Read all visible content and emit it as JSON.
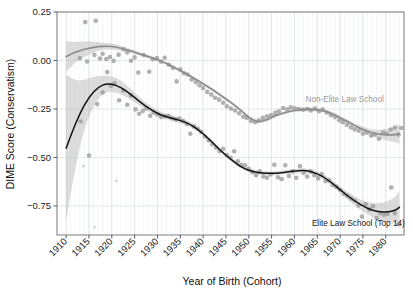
{
  "chart_data": {
    "type": "line",
    "title": "",
    "subtitle": "",
    "xlabel": "Year of Birth (Cohort)",
    "ylabel": "DIME Score (Conservatism)",
    "xlim": [
      1908,
      1984
    ],
    "ylim": [
      -0.9,
      0.25
    ],
    "grid": true,
    "legend_position": "inline-annotation",
    "xticks": [
      1910,
      1915,
      1920,
      1925,
      1930,
      1935,
      1940,
      1945,
      1950,
      1955,
      1960,
      1965,
      1970,
      1975,
      1980
    ],
    "xtick_labels": [
      "1910",
      "1915",
      "1920",
      "1925",
      "1930",
      "1935",
      "1940",
      "1945",
      "1950",
      "1955",
      "1960",
      "1965",
      "1970",
      "1975",
      "1980"
    ],
    "yticks": [
      0.25,
      0.0,
      -0.25,
      -0.5,
      -0.75
    ],
    "ytick_labels": [
      "0.25",
      "0.00",
      "−0.25",
      "−0.50",
      "−0.75"
    ],
    "annotations": [
      {
        "text": "Non-Elite Law School",
        "x": 1971,
        "y": -0.215,
        "color": "#9a9a9a"
      },
      {
        "text": "Elite Law School (Top 14)",
        "x": 1974,
        "y": -0.855,
        "color": "#1a1a1a"
      }
    ],
    "series": [
      {
        "name": "Non-Elite Law School",
        "color": "#8d8d8d",
        "band_color": "#b9b9b9",
        "x": [
          1910,
          1912,
          1914,
          1916,
          1918,
          1920,
          1922,
          1924,
          1926,
          1928,
          1930,
          1932,
          1934,
          1936,
          1938,
          1940,
          1942,
          1944,
          1946,
          1948,
          1950,
          1952,
          1954,
          1956,
          1958,
          1960,
          1962,
          1964,
          1966,
          1968,
          1970,
          1972,
          1974,
          1976,
          1978,
          1980,
          1982,
          1983
        ],
        "values": [
          0.02,
          0.042,
          0.058,
          0.068,
          0.073,
          0.072,
          0.063,
          0.05,
          0.035,
          0.02,
          0.004,
          -0.016,
          -0.04,
          -0.065,
          -0.092,
          -0.12,
          -0.15,
          -0.182,
          -0.215,
          -0.252,
          -0.292,
          -0.315,
          -0.305,
          -0.283,
          -0.268,
          -0.258,
          -0.252,
          -0.252,
          -0.258,
          -0.272,
          -0.295,
          -0.32,
          -0.345,
          -0.365,
          -0.378,
          -0.383,
          -0.382,
          -0.378
        ],
        "band_lower": [
          -0.06,
          -0.012,
          0.018,
          0.04,
          0.054,
          0.056,
          0.05,
          0.04,
          0.026,
          0.012,
          -0.003,
          -0.023,
          -0.047,
          -0.072,
          -0.099,
          -0.127,
          -0.157,
          -0.189,
          -0.222,
          -0.259,
          -0.3,
          -0.323,
          -0.313,
          -0.291,
          -0.276,
          -0.266,
          -0.26,
          -0.26,
          -0.266,
          -0.281,
          -0.305,
          -0.331,
          -0.358,
          -0.381,
          -0.399,
          -0.412,
          -0.422,
          -0.428
        ],
        "band_upper": [
          0.1,
          0.096,
          0.098,
          0.096,
          0.092,
          0.088,
          0.076,
          0.06,
          0.044,
          0.028,
          0.011,
          -0.009,
          -0.033,
          -0.058,
          -0.085,
          -0.113,
          -0.143,
          -0.175,
          -0.208,
          -0.245,
          -0.284,
          -0.307,
          -0.297,
          -0.275,
          -0.26,
          -0.25,
          -0.244,
          -0.244,
          -0.25,
          -0.263,
          -0.285,
          -0.309,
          -0.332,
          -0.349,
          -0.357,
          -0.354,
          -0.342,
          -0.328
        ]
      },
      {
        "name": "Elite Law School (Top 14)",
        "color": "#111111",
        "band_color": "#b9b9b9",
        "x": [
          1910,
          1912,
          1914,
          1916,
          1918,
          1920,
          1922,
          1924,
          1926,
          1928,
          1930,
          1932,
          1934,
          1936,
          1938,
          1940,
          1942,
          1944,
          1946,
          1948,
          1950,
          1952,
          1954,
          1956,
          1958,
          1960,
          1962,
          1964,
          1966,
          1968,
          1970,
          1972,
          1974,
          1976,
          1978,
          1980,
          1982,
          1983
        ],
        "values": [
          -0.452,
          -0.33,
          -0.23,
          -0.162,
          -0.127,
          -0.122,
          -0.14,
          -0.172,
          -0.21,
          -0.245,
          -0.272,
          -0.29,
          -0.303,
          -0.318,
          -0.342,
          -0.378,
          -0.422,
          -0.468,
          -0.508,
          -0.543,
          -0.566,
          -0.578,
          -0.582,
          -0.581,
          -0.576,
          -0.57,
          -0.568,
          -0.576,
          -0.596,
          -0.628,
          -0.666,
          -0.704,
          -0.736,
          -0.762,
          -0.777,
          -0.781,
          -0.772,
          -0.757
        ],
        "band_lower": [
          -0.83,
          -0.56,
          -0.36,
          -0.24,
          -0.175,
          -0.162,
          -0.175,
          -0.2,
          -0.232,
          -0.263,
          -0.288,
          -0.305,
          -0.317,
          -0.331,
          -0.354,
          -0.389,
          -0.432,
          -0.478,
          -0.518,
          -0.553,
          -0.576,
          -0.588,
          -0.592,
          -0.591,
          -0.587,
          -0.581,
          -0.58,
          -0.589,
          -0.61,
          -0.644,
          -0.684,
          -0.725,
          -0.762,
          -0.794,
          -0.818,
          -0.833,
          -0.84,
          -0.842
        ],
        "band_upper": [
          -0.074,
          -0.1,
          -0.1,
          -0.084,
          -0.079,
          -0.082,
          -0.105,
          -0.144,
          -0.188,
          -0.227,
          -0.256,
          -0.275,
          -0.289,
          -0.305,
          -0.33,
          -0.367,
          -0.412,
          -0.458,
          -0.498,
          -0.533,
          -0.556,
          -0.568,
          -0.572,
          -0.571,
          -0.565,
          -0.559,
          -0.556,
          -0.563,
          -0.582,
          -0.612,
          -0.648,
          -0.683,
          -0.71,
          -0.73,
          -0.736,
          -0.729,
          -0.704,
          -0.672
        ]
      }
    ],
    "scatter": [
      {
        "name": "Non-Elite Law School",
        "color": "#9b9b9b",
        "points": [
          [
            1914.2,
            0.198
          ],
          [
            1916.5,
            0.205
          ],
          [
            1913.0,
            0.012
          ],
          [
            1914.6,
            -0.005
          ],
          [
            1916.2,
            0.028
          ],
          [
            1917.4,
            0.01
          ],
          [
            1918.0,
            0.035
          ],
          [
            1918.8,
            0.008
          ],
          [
            1919.6,
            0.018
          ],
          [
            1920.4,
            -0.002
          ],
          [
            1921.5,
            0.03
          ],
          [
            1922.6,
            0.058
          ],
          [
            1923.4,
            0.042
          ],
          [
            1924.2,
            -0.002
          ],
          [
            1925.0,
            0.016
          ],
          [
            1925.8,
            -0.062
          ],
          [
            1927.0,
            0.028
          ],
          [
            1928.2,
            -0.058
          ],
          [
            1929.0,
            0.006
          ],
          [
            1929.9,
            0.012
          ],
          [
            1930.8,
            -0.006
          ],
          [
            1931.6,
            0.014
          ],
          [
            1932.5,
            -0.022
          ],
          [
            1933.4,
            -0.038
          ],
          [
            1934.2,
            -0.108
          ],
          [
            1935.0,
            -0.046
          ],
          [
            1935.8,
            -0.066
          ],
          [
            1936.6,
            -0.072
          ],
          [
            1937.5,
            -0.098
          ],
          [
            1938.4,
            -0.112
          ],
          [
            1939.2,
            -0.128
          ],
          [
            1940.0,
            -0.142
          ],
          [
            1940.9,
            -0.162
          ],
          [
            1941.8,
            -0.176
          ],
          [
            1942.6,
            -0.192
          ],
          [
            1943.5,
            -0.202
          ],
          [
            1944.4,
            -0.218
          ],
          [
            1945.2,
            -0.236
          ],
          [
            1946.1,
            -0.248
          ],
          [
            1947.0,
            -0.258
          ],
          [
            1947.9,
            -0.272
          ],
          [
            1948.8,
            -0.29
          ],
          [
            1949.6,
            -0.296
          ],
          [
            1950.5,
            -0.312
          ],
          [
            1951.4,
            -0.318
          ],
          [
            1952.2,
            -0.308
          ],
          [
            1953.1,
            -0.296
          ],
          [
            1954.0,
            -0.288
          ],
          [
            1954.9,
            -0.282
          ],
          [
            1955.8,
            -0.27
          ],
          [
            1956.6,
            -0.262
          ],
          [
            1957.5,
            -0.245
          ],
          [
            1958.4,
            -0.252
          ],
          [
            1959.2,
            -0.242
          ],
          [
            1960.1,
            -0.246
          ],
          [
            1961.0,
            -0.25
          ],
          [
            1961.9,
            -0.254
          ],
          [
            1962.8,
            -0.25
          ],
          [
            1963.6,
            -0.258
          ],
          [
            1964.5,
            -0.248
          ],
          [
            1965.4,
            -0.262
          ],
          [
            1966.2,
            -0.252
          ],
          [
            1967.1,
            -0.268
          ],
          [
            1968.0,
            -0.282
          ],
          [
            1968.9,
            -0.292
          ],
          [
            1969.8,
            -0.308
          ],
          [
            1970.6,
            -0.318
          ],
          [
            1971.5,
            -0.332
          ],
          [
            1972.4,
            -0.345
          ],
          [
            1973.2,
            -0.356
          ],
          [
            1974.1,
            -0.362
          ],
          [
            1975.0,
            -0.378
          ],
          [
            1975.9,
            -0.372
          ],
          [
            1976.8,
            -0.388
          ],
          [
            1977.6,
            -0.382
          ],
          [
            1978.5,
            -0.404
          ],
          [
            1979.4,
            -0.372
          ],
          [
            1980.2,
            -0.378
          ],
          [
            1981.1,
            -0.356
          ],
          [
            1982.0,
            -0.346
          ],
          [
            1982.8,
            -0.382
          ],
          [
            1983.4,
            -0.348
          ]
        ]
      },
      {
        "name": "Elite Law School (Top 14)",
        "color": "#8f8f8f",
        "points": [
          [
            1913.2,
            -0.315
          ],
          [
            1915.0,
            -0.49
          ],
          [
            1916.8,
            -0.225
          ],
          [
            1918.0,
            -0.165
          ],
          [
            1919.0,
            -0.06
          ],
          [
            1919.8,
            -0.13
          ],
          [
            1920.6,
            -0.118
          ],
          [
            1921.6,
            -0.205
          ],
          [
            1922.5,
            -0.155
          ],
          [
            1923.4,
            -0.228
          ],
          [
            1924.2,
            -0.18
          ],
          [
            1925.2,
            -0.252
          ],
          [
            1926.0,
            -0.275
          ],
          [
            1926.8,
            -0.26
          ],
          [
            1927.6,
            -0.248
          ],
          [
            1928.4,
            -0.285
          ],
          [
            1929.2,
            -0.268
          ],
          [
            1930.0,
            -0.278
          ],
          [
            1930.8,
            -0.292
          ],
          [
            1931.6,
            -0.288
          ],
          [
            1932.4,
            -0.285
          ],
          [
            1933.2,
            -0.298
          ],
          [
            1934.0,
            -0.305
          ],
          [
            1934.8,
            -0.3
          ],
          [
            1935.6,
            -0.312
          ],
          [
            1936.4,
            -0.326
          ],
          [
            1937.2,
            -0.378
          ],
          [
            1938.0,
            -0.34
          ],
          [
            1938.8,
            -0.352
          ],
          [
            1939.6,
            -0.368
          ],
          [
            1940.4,
            -0.392
          ],
          [
            1941.2,
            -0.412
          ],
          [
            1942.0,
            -0.432
          ],
          [
            1942.8,
            -0.45
          ],
          [
            1943.6,
            -0.468
          ],
          [
            1944.4,
            -0.455
          ],
          [
            1945.2,
            -0.488
          ],
          [
            1946.0,
            -0.502
          ],
          [
            1946.8,
            -0.468
          ],
          [
            1947.6,
            -0.52
          ],
          [
            1948.4,
            -0.538
          ],
          [
            1949.2,
            -0.54
          ],
          [
            1950.0,
            -0.558
          ],
          [
            1950.8,
            -0.576
          ],
          [
            1951.6,
            -0.592
          ],
          [
            1952.4,
            -0.572
          ],
          [
            1953.2,
            -0.598
          ],
          [
            1954.0,
            -0.605
          ],
          [
            1954.8,
            -0.588
          ],
          [
            1955.6,
            -0.538
          ],
          [
            1956.4,
            -0.602
          ],
          [
            1957.2,
            -0.612
          ],
          [
            1958.0,
            -0.54
          ],
          [
            1958.8,
            -0.596
          ],
          [
            1959.6,
            -0.572
          ],
          [
            1960.4,
            -0.605
          ],
          [
            1961.2,
            -0.545
          ],
          [
            1962.0,
            -0.58
          ],
          [
            1962.8,
            -0.598
          ],
          [
            1963.6,
            -0.572
          ],
          [
            1964.4,
            -0.592
          ],
          [
            1965.2,
            -0.608
          ],
          [
            1966.0,
            -0.586
          ],
          [
            1966.8,
            -0.622
          ],
          [
            1967.6,
            -0.618
          ],
          [
            1968.4,
            -0.642
          ],
          [
            1969.2,
            -0.652
          ],
          [
            1970.0,
            -0.668
          ],
          [
            1970.8,
            -0.688
          ],
          [
            1971.6,
            -0.698
          ],
          [
            1972.4,
            -0.712
          ],
          [
            1973.2,
            -0.722
          ],
          [
            1974.0,
            -0.748
          ],
          [
            1974.8,
            -0.805
          ],
          [
            1975.6,
            -0.742
          ],
          [
            1976.4,
            -0.768
          ],
          [
            1977.2,
            -0.752
          ],
          [
            1978.0,
            -0.812
          ],
          [
            1978.8,
            -0.788
          ],
          [
            1979.6,
            -0.795
          ],
          [
            1980.4,
            -0.792
          ],
          [
            1981.2,
            -0.655
          ],
          [
            1982.0,
            -0.788
          ],
          [
            1982.8,
            -0.845
          ]
        ]
      }
    ]
  }
}
